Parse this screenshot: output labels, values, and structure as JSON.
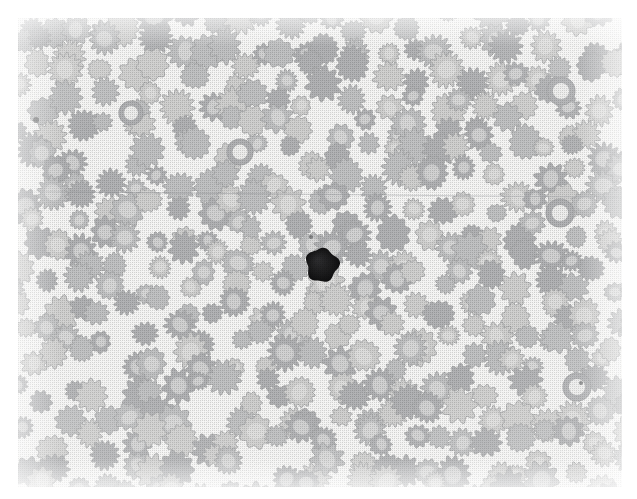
{
  "image": {
    "kind": "photomicrograph",
    "subject": "peripheral blood smear",
    "caption_visible": "",
    "width_px": 637,
    "height_px": 499,
    "page_background": "#ffffff",
    "plate": {
      "left_px": 18,
      "top_px": 18,
      "width_px": 604,
      "height_px": 469,
      "background": "#f7f7f6",
      "print_style": "halftone dot screen",
      "halftone_pitch_px": 2
    },
    "artifacts": [
      {
        "name": "horizontal-crease-line",
        "y_px": 191,
        "slope_px": 6,
        "color": "#8e9094",
        "description": "faint slanted scan/fold line crossing the full width"
      }
    ]
  },
  "field": {
    "background_color": "#f7f7f6",
    "cell_fill_light": "#d2d2d1",
    "cell_fill_mid": "#c2c3c4",
    "cell_fill_dark": "#b3b4b6",
    "cell_edge_color": "#a9aaac",
    "pallor_color": "#e8e8e7",
    "dense_cell_color": "#1b1b1c",
    "estimated_cell_count": 330,
    "cell_radius_min_px": 9,
    "cell_radius_max_px": 16,
    "cell_morphology": "crenated / spiculated erythrocytes (echinocytes, burr cells)",
    "spicule_count_min": 9,
    "spicule_count_max": 15
  },
  "features": [
    {
      "name": "dark-nucleated-cell",
      "label": "",
      "center_x_px": 322,
      "center_y_px": 265,
      "radius_px": 16,
      "color": "#1b1b1c",
      "description": "single densely stained nucleated cell (leukocyte / nucleated RBC) near the centre of the field"
    },
    {
      "name": "pale-ring-cell-upper-right",
      "center_x_px": 561,
      "center_y_px": 91,
      "radius_px": 14,
      "description": "erythrocyte with prominent central pallor forming a ring"
    },
    {
      "name": "pale-ring-cell-mid-right",
      "center_x_px": 560,
      "center_y_px": 213,
      "radius_px": 14,
      "description": "erythrocyte with prominent central pallor forming a ring"
    },
    {
      "name": "pale-ring-cell-lower-right",
      "center_x_px": 577,
      "center_y_px": 387,
      "radius_px": 14,
      "description": "erythrocyte with prominent central pallor forming a ring"
    },
    {
      "name": "pale-ring-cell-centre",
      "center_x_px": 240,
      "center_y_px": 152,
      "radius_px": 13,
      "description": "erythrocyte with prominent central pallor forming a ring"
    },
    {
      "name": "pale-ring-cell-left",
      "center_x_px": 131,
      "center_y_px": 113,
      "radius_px": 12,
      "description": "smooth erythrocyte with central pallor"
    },
    {
      "name": "platelet-speck-left",
      "center_x_px": 36,
      "center_y_px": 120,
      "radius_px": 3,
      "description": "small dark speck, platelet or debris"
    },
    {
      "name": "platelet-speck-centre",
      "center_x_px": 311,
      "center_y_px": 237,
      "radius_px": 2,
      "description": "small dark speck adjacent to the dense cell"
    },
    {
      "name": "platelet-speck-right",
      "center_x_px": 581,
      "center_y_px": 383,
      "radius_px": 2,
      "description": "small dark speck, platelet or debris"
    }
  ],
  "seed": {
    "rng": 20240517
  }
}
